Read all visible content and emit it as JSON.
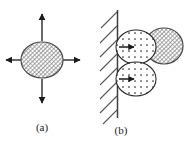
{
  "figure": {
    "type": "scientific-diagram",
    "width": 184,
    "height": 142,
    "background_color": "#ffffff",
    "stroke_color": "#1a1a1a"
  },
  "panels": [
    {
      "id": "panel-a",
      "caption": "(a)",
      "caption_x": 42,
      "caption_y": 131,
      "particle": {
        "name": "hatched-circle",
        "cx": 42,
        "cy": 60,
        "rx": 21,
        "ry": 18,
        "fill_pattern": "diagonal-cross-hatch",
        "fill_color": "#8a8a8a"
      },
      "arrows": [
        {
          "name": "arrow-up",
          "x1": 42,
          "y1": 41,
          "x2": 42,
          "y2": 12,
          "direction": "up"
        },
        {
          "name": "arrow-down",
          "x1": 42,
          "y1": 79,
          "x2": 42,
          "y2": 105,
          "direction": "down"
        },
        {
          "name": "arrow-left",
          "x1": 20,
          "y1": 60,
          "x2": 4,
          "y2": 60,
          "direction": "left"
        },
        {
          "name": "arrow-right",
          "x1": 64,
          "y1": 60,
          "x2": 82,
          "y2": 60,
          "direction": "right"
        }
      ]
    },
    {
      "id": "panel-b",
      "caption": "(b)",
      "caption_x": 121,
      "caption_y": 134,
      "wall": {
        "name": "rigid-wall",
        "x": 117,
        "y_top": 10,
        "y_bottom": 118,
        "hatch_side": "left",
        "hatch_count": 8,
        "hatch_angle_deg": 45
      },
      "stippled_circles": [
        {
          "name": "stippled-circle-upper",
          "cx": 136,
          "cy": 47,
          "rx": 20,
          "ry": 17,
          "fill_pattern": "dot-grid",
          "arrow": {
            "name": "arrow-right-upper",
            "x1": 118,
            "y1": 47,
            "x2": 134,
            "y2": 47,
            "direction": "right"
          }
        },
        {
          "name": "stippled-circle-lower",
          "cx": 136,
          "cy": 79,
          "rx": 20,
          "ry": 17,
          "fill_pattern": "dot-grid",
          "arrow": {
            "name": "arrow-right-lower",
            "x1": 118,
            "y1": 79,
            "x2": 134,
            "y2": 79,
            "direction": "right"
          }
        }
      ],
      "hatched_circle": {
        "name": "hatched-circle-offset",
        "cx": 164,
        "cy": 46,
        "rx": 19,
        "ry": 18,
        "fill_pattern": "diagonal-cross-hatch",
        "fill_color": "#8a8a8a"
      }
    }
  ]
}
